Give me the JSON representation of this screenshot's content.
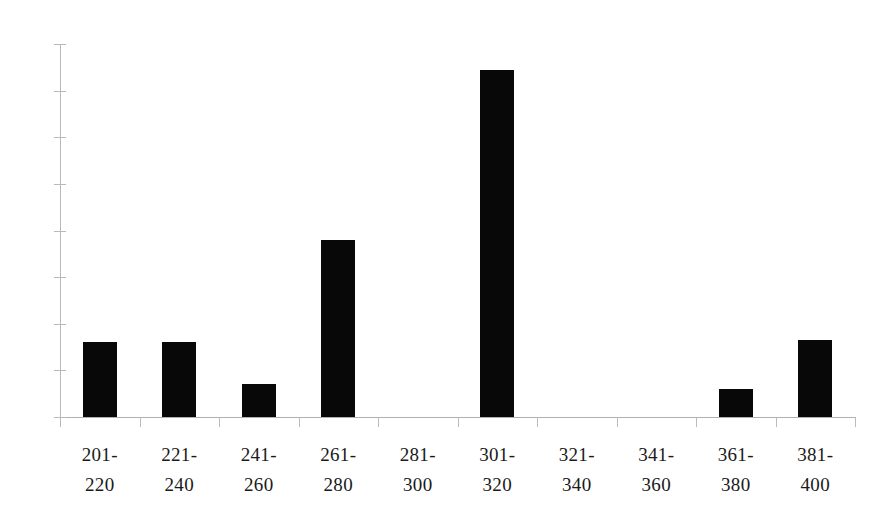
{
  "chart_data": {
    "type": "bar",
    "title": "",
    "subtitle": "",
    "xlabel": "",
    "ylabel": "",
    "categories": [
      "201-220",
      "221-240",
      "241-260",
      "261-280",
      "281-300",
      "301-320",
      "321-340",
      "341-360",
      "361-380",
      "381-400"
    ],
    "category_lines": [
      [
        "201-",
        "220"
      ],
      [
        "221-",
        "240"
      ],
      [
        "241-",
        "260"
      ],
      [
        "261-",
        "280"
      ],
      [
        "281-",
        "300"
      ],
      [
        "301-",
        "320"
      ],
      [
        "321-",
        "340"
      ],
      [
        "341-",
        "360"
      ],
      [
        "361-",
        "380"
      ],
      [
        "381-",
        "400"
      ]
    ],
    "values": [
      0.16,
      0.16,
      0.07,
      0.38,
      0.0,
      0.745,
      0.0,
      0.0,
      0.06,
      0.165
    ],
    "ylim": [
      0,
      0.8
    ],
    "ytick_labels": [
      "0.8",
      "0.7",
      "0.6",
      "0.5",
      "0.4",
      "0.3",
      "0.2",
      "0.1",
      "0"
    ],
    "ytick_values": [
      0.8,
      0.7,
      0.6,
      0.5,
      0.4,
      0.3,
      0.2,
      0.1,
      0
    ],
    "grid": false,
    "legend": null,
    "legend_position": "none",
    "bar_color": "#080808",
    "axis_color": "#b9b9b9",
    "background_color": "#ffffff",
    "annotations": []
  },
  "layout": {
    "plot_left": 60,
    "plot_right": 855,
    "baseline_y": 417,
    "top_y": 44,
    "pixels_per_unit": 466,
    "bar_width": 34,
    "slot_width": 79.5
  }
}
